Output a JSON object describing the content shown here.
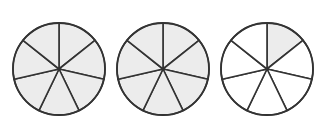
{
  "diagram": {
    "type": "fraction-circles",
    "represents": "2 1/7",
    "sectors_per_circle": 7,
    "colors": {
      "background": "#ffffff",
      "shaded_fill": "#ececec",
      "unshaded_fill": "#ffffff",
      "stroke": "#333333"
    },
    "circles": [
      {
        "cx": 59,
        "cy": 69,
        "r": 46,
        "shaded_sectors": 7
      },
      {
        "cx": 163,
        "cy": 69,
        "r": 46,
        "shaded_sectors": 7
      },
      {
        "cx": 267,
        "cy": 69,
        "r": 46,
        "shaded_sectors": 1
      }
    ]
  }
}
